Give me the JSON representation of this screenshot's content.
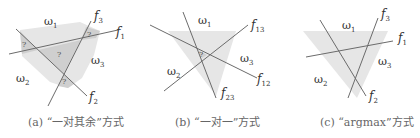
{
  "colors": {
    "line": "#6b6b6b",
    "shade_light": "#e6e6e6",
    "shade_dark": "#cdcdcd",
    "text": "#333333",
    "caption": "#666666"
  },
  "panels": [
    {
      "id": "a",
      "caption": "(a) “一对其余”方式",
      "regions": {
        "w1": "ω",
        "w1_sub": "1",
        "w2": "ω",
        "w2_sub": "2",
        "w3": "ω",
        "w3_sub": "3"
      },
      "lines": [
        {
          "name": "f",
          "sub": "1"
        },
        {
          "name": "f",
          "sub": "2"
        },
        {
          "name": "f",
          "sub": "3"
        }
      ],
      "ambiguous_marks": [
        "?",
        "?",
        "?",
        "?"
      ]
    },
    {
      "id": "b",
      "caption": "(b) “一对一”方式",
      "regions": {
        "w1": "ω",
        "w1_sub": "1",
        "w2": "ω",
        "w2_sub": "2",
        "w3": "ω",
        "w3_sub": "3"
      },
      "lines": [
        {
          "name": "f",
          "sub": "13"
        },
        {
          "name": "f",
          "sub": "12"
        },
        {
          "name": "f",
          "sub": "23"
        }
      ],
      "ambiguous_marks": [
        "?"
      ]
    },
    {
      "id": "c",
      "caption": "(c) “argmax”方式",
      "regions": {
        "w1": "ω",
        "w1_sub": "1",
        "w2": "ω",
        "w2_sub": "2",
        "w3": "ω",
        "w3_sub": "3"
      },
      "lines": [
        {
          "name": "f",
          "sub": "1"
        },
        {
          "name": "f",
          "sub": "2"
        },
        {
          "name": "f",
          "sub": "3"
        }
      ],
      "ambiguous_marks": []
    }
  ]
}
